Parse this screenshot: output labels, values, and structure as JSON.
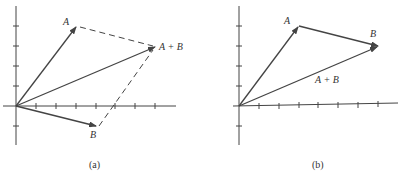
{
  "figure": {
    "panels": [
      {
        "id": "a",
        "caption": "(a)",
        "method": "parallelogram",
        "labels": {
          "A": "A",
          "B": "B",
          "sum": "A + B"
        },
        "vectors": {
          "A": [
            3,
            4
          ],
          "B": [
            4,
            -1
          ],
          "sum": [
            7,
            3
          ]
        }
      },
      {
        "id": "b",
        "caption": "(b)",
        "method": "head-to-tail",
        "labels": {
          "A": "A",
          "B": "B",
          "sum": "A + B"
        },
        "vectors": {
          "A": [
            3,
            4
          ],
          "B": [
            4,
            -1
          ],
          "sum": [
            7,
            3
          ]
        }
      }
    ],
    "colors": {
      "ink": "#444444",
      "background": "#ffffff"
    }
  }
}
